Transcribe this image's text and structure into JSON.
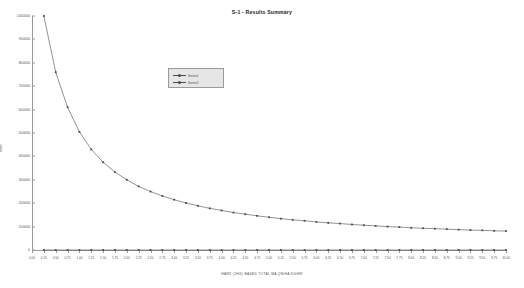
{
  "chart_data": {
    "type": "line",
    "title": "S-1 - Results Summary",
    "xlabel": "HARV (1HG)  BASED  TOTAL MA QN/HA  KG/HR",
    "ylabel": "MRR",
    "xlim": [
      0,
      10
    ],
    "ylim": [
      0,
      1000000
    ],
    "grid": false,
    "legend_position": "upper-left-inside",
    "x_ticks": [
      "0.00",
      "0.25",
      "0.50",
      "0.75",
      "1.00",
      "1.25",
      "1.50",
      "1.75",
      "2.00",
      "2.25",
      "2.50",
      "2.75",
      "3.00",
      "3.25",
      "3.50",
      "3.75",
      "4.00",
      "4.25",
      "4.50",
      "4.75",
      "5.00",
      "5.25",
      "5.50",
      "5.75",
      "6.00",
      "6.25",
      "6.50",
      "6.75",
      "7.00",
      "7.25",
      "7.50",
      "7.75",
      "8.00",
      "8.25",
      "8.50",
      "8.75",
      "9.00",
      "9.25",
      "9.50",
      "9.75",
      "10.00"
    ],
    "y_ticks": [
      "1000000",
      "900000",
      "800000",
      "700000",
      "600000",
      "500000",
      "400000",
      "300000",
      "200000",
      "100000",
      "0"
    ],
    "x": [
      0.25,
      0.5,
      0.75,
      1.0,
      1.25,
      1.5,
      1.75,
      2.0,
      2.25,
      2.5,
      2.75,
      3.0,
      3.25,
      3.5,
      3.75,
      4.0,
      4.25,
      4.5,
      4.75,
      5.0,
      5.25,
      5.5,
      5.75,
      6.0,
      6.25,
      6.5,
      6.75,
      7.0,
      7.25,
      7.5,
      7.75,
      8.0,
      8.25,
      8.5,
      8.75,
      9.0,
      9.25,
      9.5,
      9.75,
      10.0
    ],
    "series": [
      {
        "name": "Series1",
        "color": "#4a4a4a",
        "values": [
          1000000,
          760000,
          610000,
          505000,
          430000,
          375000,
          333000,
          300000,
          272000,
          250000,
          231000,
          215000,
          201000,
          189000,
          178000,
          169000,
          160000,
          153000,
          146000,
          140000,
          134000,
          129000,
          125000,
          120000,
          116000,
          113000,
          109000,
          106000,
          103000,
          100000,
          98000,
          95000,
          93000,
          91000,
          89000,
          87000,
          85000,
          84000,
          82000,
          81000
        ]
      },
      {
        "name": "Series2",
        "color": "#4a4a4a",
        "values": [
          0,
          0,
          0,
          0,
          0,
          0,
          0,
          0,
          0,
          0,
          0,
          0,
          0,
          0,
          0,
          0,
          0,
          0,
          0,
          0,
          0,
          0,
          0,
          0,
          0,
          0,
          0,
          0,
          0,
          0,
          0,
          0,
          0,
          0,
          0,
          0,
          0,
          0,
          0,
          0
        ]
      }
    ]
  },
  "legend": {
    "items": [
      {
        "label": "Series1"
      },
      {
        "label": "Series2"
      }
    ]
  }
}
